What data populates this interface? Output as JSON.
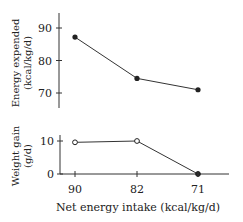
{
  "chart_data": [
    {
      "type": "line",
      "ylabel": "Energy expended",
      "ylabel_units": "(kcal/kg/d)",
      "xlabel": "",
      "categories": [
        "90",
        "82",
        "71"
      ],
      "yticks": [
        70,
        80,
        90
      ],
      "ylim": [
        65,
        95
      ],
      "series": [
        {
          "name": "Energy expended",
          "marker": "filled-circle",
          "values": [
            87.2,
            74.5,
            71.0
          ]
        }
      ]
    },
    {
      "type": "line",
      "ylabel": "Weight gain",
      "ylabel_units": "(g/d)",
      "xlabel": "Net energy intake (kcal/kg/d)",
      "categories": [
        "90",
        "82",
        "71"
      ],
      "yticks": [
        0,
        10
      ],
      "ylim": [
        0,
        11.5
      ],
      "series": [
        {
          "name": "Weight gain",
          "markers": [
            "open-circle",
            "open-circle",
            "filled-circle"
          ],
          "values": [
            9.6,
            10.0,
            0
          ]
        }
      ]
    }
  ]
}
